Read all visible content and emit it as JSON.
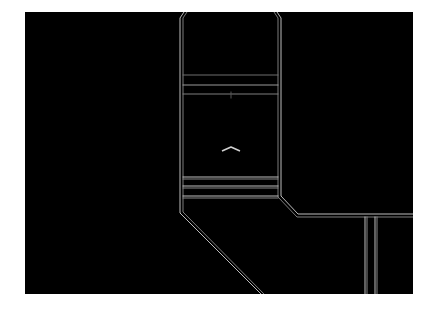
{
  "scene": {
    "type": "top-down wireframe map",
    "background_color": "#000000",
    "frame_color": "#ffffff",
    "line_color": "#c8c8c8",
    "dim_line_color": "#8a8a8a",
    "player_marker": {
      "icon": "chevron-up-icon",
      "color": "#d0d0d0"
    }
  }
}
